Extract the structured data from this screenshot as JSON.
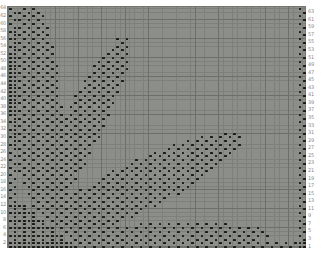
{
  "page": {
    "background": "#ffffff"
  },
  "chart_data": {
    "type": "heatmap",
    "subtype": "knitting-stitch-pattern-chart",
    "grid": {
      "rows": 64,
      "cols": 64
    },
    "left_row_labels": [
      64,
      62,
      60,
      58,
      56,
      54,
      52,
      50,
      48,
      46,
      44,
      42,
      40,
      38,
      36,
      34,
      32,
      30,
      28,
      26,
      24,
      22,
      20,
      18,
      16,
      14,
      12,
      10,
      8,
      6,
      4,
      2
    ],
    "right_row_labels": [
      63,
      61,
      59,
      57,
      55,
      53,
      51,
      49,
      47,
      45,
      43,
      41,
      39,
      37,
      35,
      33,
      31,
      29,
      27,
      25,
      23,
      21,
      19,
      17,
      15,
      13,
      11,
      9,
      7,
      5,
      3,
      1
    ],
    "cell_fill": "checkerboard-dots",
    "motifs": {
      "leaves": [
        {
          "name": "leaf-left-vertical",
          "cx": 6.5,
          "cy": 38,
          "a": 27.5,
          "b": 5.6,
          "angle_deg": 93
        },
        {
          "name": "leaf-upper-diagonal",
          "cx": 16,
          "cy": 32,
          "a": 27,
          "b": 4.6,
          "angle_deg": 68
        },
        {
          "name": "leaf-middle-diagonal",
          "cx": 28.5,
          "cy": 17,
          "a": 25.5,
          "b": 6.4,
          "angle_deg": 31
        },
        {
          "name": "leaf-lower-horizontal",
          "cx": 32,
          "cy": 4,
          "a": 25,
          "b": 3.2,
          "angle_deg": 2
        }
      ],
      "base_triangle": {
        "max_row": 13,
        "col_plus_row_max": 16
      },
      "borders": {
        "left_cols": 2,
        "right_cols": 2,
        "bottom_rows": 2,
        "style": "seed-stitch"
      }
    },
    "colors": {
      "grid_bg": "#8c8e89",
      "grid_line": "#7e807b",
      "grid_line_major": "#6d6f6a",
      "dot": "#1a1a1a",
      "row_label": "#8b8b8b",
      "margin": "#ffffff"
    }
  }
}
